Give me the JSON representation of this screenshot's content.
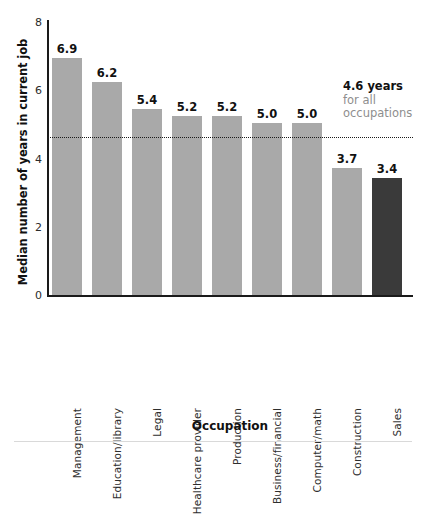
{
  "chart_data": {
    "type": "bar",
    "title": "",
    "xlabel": "Occupation",
    "ylabel": "Median number of years in current job",
    "categories": [
      "Management",
      "Education/library",
      "Legal",
      "Healthcare provider",
      "Production",
      "Business/financial",
      "Computer/math",
      "Construction",
      "Sales"
    ],
    "values": [
      6.9,
      6.2,
      5.4,
      5.2,
      5.2,
      5.0,
      5.0,
      3.7,
      3.4
    ],
    "value_labels": [
      "6.9",
      "6.2",
      "5.4",
      "5.2",
      "5.2",
      "5.0",
      "5.0",
      "3.7",
      "3.4"
    ],
    "highlight_index": 8,
    "ylim": [
      0,
      8
    ],
    "yticks": [
      8,
      6,
      4,
      2,
      0
    ],
    "ytick_labels": [
      "8",
      "6",
      "4",
      "2",
      "0"
    ],
    "grid": false,
    "legend": "none",
    "bar_color": "#a9a9a9",
    "highlight_color": "#3a3a3a",
    "reference_line": {
      "value": 4.6,
      "style": "dotted",
      "color": "#1b1b1b",
      "annotation_main": "4.6 years",
      "annotation_sub_line1": "for all",
      "annotation_sub_line2": "occupations",
      "annotation_sub_color": "#8e8e8e"
    }
  }
}
